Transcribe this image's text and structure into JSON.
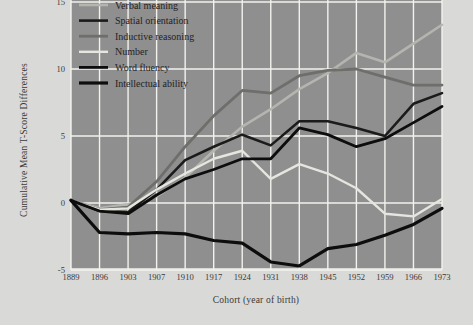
{
  "figure": {
    "background_color": "#d9d9d7",
    "plot_background_color": "#8f8f8f",
    "grid_color": "#f2f2ee",
    "border_color": "#a8a8a4"
  },
  "chart_data": {
    "type": "line",
    "title": "",
    "xlabel": "Cohort (year of birth)",
    "ylabel": "Cumulative Mean T-Score Differences",
    "categories": [
      "1889",
      "1896",
      "1903",
      "1907",
      "1910",
      "1917",
      "1924",
      "1931",
      "1938",
      "1945",
      "1952",
      "1959",
      "1966",
      "1973"
    ],
    "x": [
      1889,
      1896,
      1903,
      1907,
      1910,
      1917,
      1924,
      1931,
      1938,
      1945,
      1952,
      1959,
      1966,
      1973
    ],
    "ylim": [
      -5,
      15
    ],
    "yticks": [
      -5,
      0,
      5,
      10,
      15
    ],
    "ytick_labels": [
      "-5",
      "0",
      "5",
      "10",
      "15"
    ],
    "grid": true,
    "legend_position": "top-left",
    "series": [
      {
        "name": "Verbal meaning",
        "color": "#b5b5b0",
        "width": 2.6,
        "values": [
          0.2,
          -0.4,
          -0.1,
          0.5,
          1.9,
          3.9,
          5.7,
          7.0,
          8.5,
          9.7,
          11.2,
          10.5,
          11.9,
          13.3
        ]
      },
      {
        "name": "Spatial orientation",
        "color": "#1b1b1b",
        "width": 2.6,
        "values": [
          0.2,
          -0.6,
          -0.7,
          1.0,
          3.2,
          4.2,
          5.1,
          4.3,
          6.1,
          6.1,
          5.6,
          5.0,
          7.4,
          8.2
        ]
      },
      {
        "name": "Inductive reasoning",
        "color": "#6e6e6b",
        "width": 2.8,
        "values": [
          0.2,
          -0.5,
          -0.3,
          1.6,
          4.2,
          6.5,
          8.4,
          8.2,
          9.5,
          9.9,
          10.0,
          9.4,
          8.8,
          8.8
        ]
      },
      {
        "name": "Number",
        "color": "#e6e6e0",
        "width": 2.4,
        "values": [
          0.2,
          -0.5,
          -0.4,
          1.0,
          2.2,
          3.3,
          3.9,
          1.8,
          2.9,
          2.2,
          1.1,
          -0.8,
          -1.0,
          0.3
        ]
      },
      {
        "name": "Word fluency",
        "color": "#0d0d0d",
        "width": 2.8,
        "values": [
          0.2,
          -0.6,
          -0.8,
          0.6,
          1.8,
          2.5,
          3.3,
          3.3,
          5.6,
          5.1,
          4.2,
          4.8,
          6.0,
          7.2
        ]
      },
      {
        "name": "Intellectual ability",
        "color": "#0d0d0d",
        "width": 3.2,
        "values": [
          0.2,
          -2.2,
          -2.3,
          -2.2,
          -2.3,
          -2.8,
          -3.0,
          -4.4,
          -4.7,
          -3.4,
          -3.1,
          -2.4,
          -1.6,
          -0.4
        ]
      }
    ]
  },
  "legend": {
    "items": [
      {
        "label": "Verbal meaning",
        "color": "#b5b5b0"
      },
      {
        "label": "Spatial orientation",
        "color": "#1b1b1b"
      },
      {
        "label": "Inductive reasoning",
        "color": "#6e6e6b"
      },
      {
        "label": "Number",
        "color": "#e6e6e0"
      },
      {
        "label": "Word fluency",
        "color": "#0d0d0d"
      },
      {
        "label": "Intellectual ability",
        "color": "#0d0d0d"
      }
    ]
  }
}
